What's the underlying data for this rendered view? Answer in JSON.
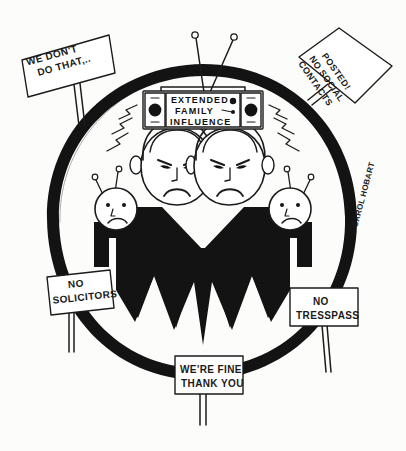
{
  "artwork": {
    "title": "Extended Family Influence cartoon",
    "medium": "hand-drawn ink cartoon",
    "background_color": "#fcfcfa",
    "ink_color": "#1b1b1b",
    "fill_color": "#131313"
  },
  "signature": {
    "text": "© CAROL HOBART",
    "orientation": "vertical"
  },
  "radio": {
    "label_line1": "EXTENDED",
    "label_line2": "FAMILY",
    "label_line3": "INFLUENCE",
    "left_knob_top": "–",
    "left_knob_bottom": "–",
    "right_knob_top": "–",
    "right_knob_bottom": "–",
    "antenna_count": "2"
  },
  "signs": [
    {
      "id": "we-dont-do-that",
      "line1": "WE DON'T",
      "line2": "DO THAT,..",
      "position": "top-left"
    },
    {
      "id": "posted-no-social-contacts",
      "line1": "POSTED!",
      "line2": "NO SOCIAL",
      "line3": "CONTACTS",
      "position": "top-right"
    },
    {
      "id": "no-solicitors",
      "line1": "NO",
      "line2": "SOLICITORS",
      "position": "bottom-left"
    },
    {
      "id": "no-tresspass",
      "line1": "NO",
      "line2": "TRESSPASS",
      "position": "bottom-right"
    },
    {
      "id": "were-fine-thank-you",
      "line1": "WE'RE FINE",
      "line2": "THANK YOU",
      "position": "bottom-center"
    }
  ],
  "figures": {
    "adults_count": "2",
    "adults_expression": "frowning",
    "children_count": "2",
    "children_expression": "sad",
    "children_feature": "antennae"
  }
}
